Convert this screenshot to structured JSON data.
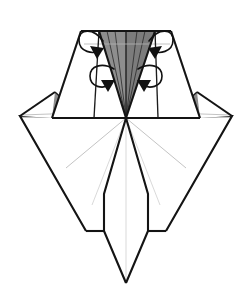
{
  "document": {
    "title": "Origami Folding Diagram",
    "subject": "crane-base-petal-fold-step",
    "background_color": "#ffffff",
    "width": 252,
    "height": 301
  },
  "palette": {
    "paper_front": "#ffffff",
    "paper_back_shaded": "#8e8e8e",
    "paper_back_shaded_dark": "#7c7c7c",
    "outline_major": "#141414",
    "outline_mid": "#1c1c1c",
    "crease_thin": "#2a2a2a",
    "crease_faint": "#b4b4b4",
    "crease_pale": "#cfcfcf",
    "arrow_color": "#111111"
  },
  "geometry": {
    "center_point": {
      "x": 126,
      "y": 118
    },
    "baseline_y": 118,
    "top_edge_y": 31,
    "tail_tip": {
      "x": 126,
      "y": 283
    },
    "left_wing_tip": {
      "x": 20,
      "y": 116
    },
    "right_wing_tip": {
      "x": 232,
      "y": 116
    }
  },
  "shapes": {
    "upper_body": {
      "name": "upper-trapezoid-body",
      "points": "81,31 171,31 200,118 52,118"
    },
    "central_gray_triangle": {
      "name": "central-petal-gray-triangle",
      "points": "99,31 155,31 126,118"
    },
    "central_gray_left_half": {
      "name": "central-petal-gray-left",
      "points": "99,31 126,31 126,118"
    },
    "central_gray_right_half": {
      "name": "central-petal-gray-right",
      "points": "126,31 155,31 126,118"
    },
    "left_inner_white_flap": {
      "name": "left-inner-white-flap",
      "points": "99,31 126,118 94,118 81,31"
    },
    "right_inner_white_flap": {
      "name": "right-inner-white-flap",
      "points": "155,31 171,31 158,118 126,118"
    },
    "left_outer_white_panel": {
      "name": "left-outer-white-panel",
      "points": "81,31 94,118 52,118"
    },
    "right_outer_white_panel": {
      "name": "right-outer-white-panel",
      "points": "171,31 200,118 158,118"
    },
    "left_wing": {
      "name": "left-wing-diamond",
      "points": "55,92 20,116 52,118"
    },
    "right_wing": {
      "name": "right-wing-diamond",
      "points": "197,92 232,116 200,118"
    },
    "left_wing_gray": {
      "name": "left-wing-gray-triangle",
      "points": "55,92 79,114 62,118 52,118"
    },
    "right_wing_gray": {
      "name": "right-wing-gray-triangle",
      "points": "197,92 173,114 190,118 200,118"
    },
    "lower_body": {
      "name": "lower-body-kite",
      "points": "126,118 232,116 166,231 126,283 86,231 20,116"
    },
    "tail": {
      "name": "tail-panel",
      "points": "104,194 148,194 166,231 126,283 86,231"
    }
  },
  "creases": {
    "central_fan": [
      "99,31 126,118",
      "155,31 126,118",
      "107,31 126,118",
      "145,31 126,118",
      "115,31 126,118",
      "137,31 126,118",
      "126,31 126,118"
    ],
    "horizontal_upper": "99,44 155,44",
    "lower_fan": [
      "126,118 20,116",
      "126,118 232,116",
      "126,118 66,168",
      "126,118 186,168",
      "126,118 86,231",
      "126,118 166,231",
      "126,118 104,194",
      "126,118 148,194",
      "126,118 126,283"
    ],
    "wing_faint": [
      "20,116 79,114",
      "232,116 173,114"
    ]
  },
  "arrows": [
    {
      "id": "arrow-top-left",
      "name": "fold-arrow-top-left",
      "type": "curved-loop-arrow",
      "direction": "inward-right",
      "path": "M 102,40 C 92,28 80,30 80,40 C 80,51 92,54 100,50",
      "head": "100,50 89,47 95,57"
    },
    {
      "id": "arrow-top-right",
      "name": "fold-arrow-top-right",
      "type": "curved-loop-arrow",
      "direction": "inward-left",
      "path": "M 152,40 C 162,28 174,30 174,40 C 174,51 162,54 154,50",
      "head": "154,50 165,47 159,57"
    },
    {
      "id": "arrow-mid-left",
      "name": "fold-arrow-mid-left",
      "type": "curved-loop-arrow",
      "direction": "inward-right",
      "path": "M 112,70 C 100,62 90,66 90,76 C 90,87 102,89 110,83",
      "head": "110,83 99,81 105,91"
    },
    {
      "id": "arrow-mid-right",
      "name": "fold-arrow-mid-right",
      "type": "curved-loop-arrow",
      "direction": "inward-left",
      "path": "M 142,70 C 154,62 164,66 164,76 C 164,87 152,89 144,83",
      "head": "144,83 155,81 149,91"
    }
  ]
}
